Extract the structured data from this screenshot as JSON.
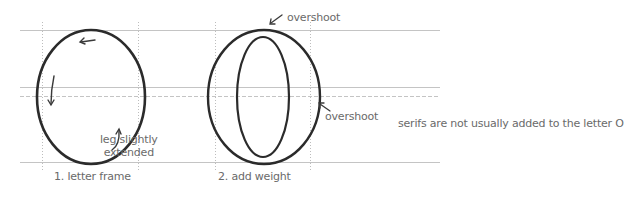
{
  "figure": {
    "panels": [
      {
        "id": "letter-frame",
        "caption": "1. letter frame",
        "annotation_line1": "leg slightly",
        "annotation_line2": "extended"
      },
      {
        "id": "add-weight",
        "caption": "2. add weight",
        "overshoot_top": "overshoot",
        "overshoot_right": "overshoot"
      }
    ],
    "note": "serifs are not usually added to the letter O",
    "colors": {
      "stroke": "#2b2b2b",
      "guide": "#bdbdbd",
      "text": "#6a6a6a"
    }
  }
}
